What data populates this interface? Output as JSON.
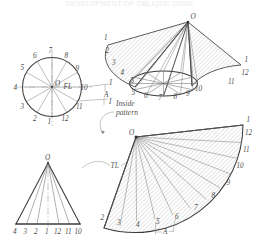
{
  "title": "DEVELOPMENT OF OBLIQUE CONE",
  "figure": {
    "type": "technical-drawing",
    "ink_color": "#3c3c3c",
    "label_color": "#4a4a4a",
    "hatch_color": "#9a9a9a",
    "background": "#ffffff"
  },
  "plan_circle": {
    "name": "plan-view-circle",
    "center_label": "O",
    "flat_label": "FL",
    "divisions": 12,
    "labels_top": [
      "6",
      "7",
      "8"
    ],
    "labels_left": [
      "4",
      "5"
    ],
    "labels_right": [
      "9",
      "10"
    ],
    "labels_bottom": [
      "3",
      "2",
      "1",
      "12",
      "11"
    ],
    "ring": [
      "1",
      "2",
      "3",
      "4",
      "5",
      "6",
      "7",
      "8",
      "9",
      "10",
      "11",
      "12"
    ]
  },
  "pictorial_cone": {
    "name": "pictorial-cone-view",
    "apex_label": "O",
    "left_labels": [
      "1",
      "2",
      "3",
      "4",
      "5"
    ],
    "base_labels": [
      "5",
      "6",
      "7",
      "8",
      "9",
      "10"
    ],
    "right_labels": [
      "1",
      "12",
      "11"
    ],
    "elements": 12
  },
  "true_length_diagram": {
    "name": "true-length-diagram",
    "apex_label": "O",
    "tl_label": "TL",
    "base_labels": [
      "4",
      "3",
      "2",
      "1",
      "12",
      "11",
      "10"
    ]
  },
  "pattern": {
    "name": "flat-pattern-development",
    "apex_label": "O",
    "caption": "Inside\npattern",
    "caption_line1": "Inside",
    "caption_line2": "pattern",
    "dimension_label": "A",
    "labels_outer": [
      "1",
      "12",
      "11",
      "10",
      "9",
      "8",
      "7",
      "6",
      "5",
      "4",
      "3",
      "2",
      "1"
    ]
  },
  "annotations": {
    "a_mark_circle": "A",
    "a_mark_pattern": "A",
    "tl_mark": "TL",
    "fl_mark": "FL"
  }
}
